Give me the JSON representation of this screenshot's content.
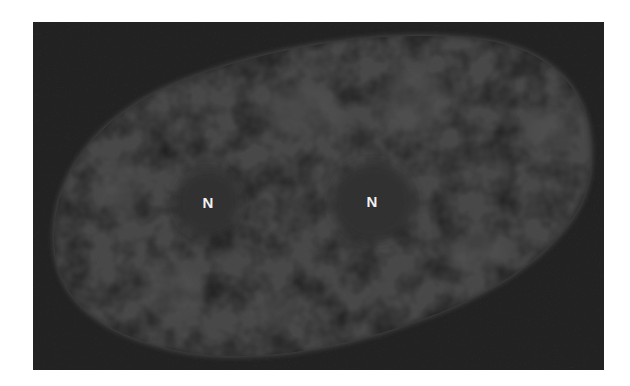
{
  "figure": {
    "labels": [
      {
        "text": "N",
        "x": 208,
        "y": 202
      },
      {
        "text": "N",
        "x": 372,
        "y": 201
      }
    ],
    "colors": {
      "page_background": "#ffffff",
      "image_background": "#242424",
      "nucleus": "#565656",
      "nucleolus": "#2a2a2a",
      "label": "#f2f2f2"
    }
  }
}
